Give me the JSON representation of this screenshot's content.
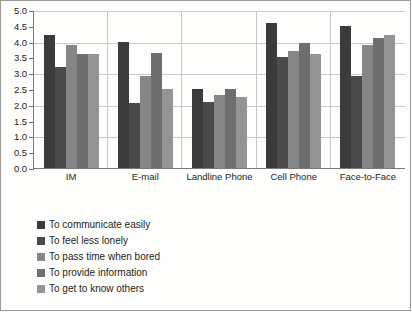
{
  "chart_data": {
    "type": "bar",
    "title": "",
    "xlabel": "",
    "ylabel": "",
    "ylim": [
      0,
      5.0
    ],
    "ytick_step": 0.5,
    "grid": true,
    "legend_position": "below",
    "categories": [
      "IM",
      "E-mail",
      "Landline Phone",
      "Cell Phone",
      "Face-to-Face"
    ],
    "ytick_labels": [
      "5.0",
      "4.5",
      "4.0",
      "3.5",
      "3.0",
      "2.5",
      "2.0",
      "1.5",
      "1.0",
      "0.5",
      "0.0"
    ],
    "ytick_values": [
      5.0,
      4.5,
      4.0,
      3.5,
      3.0,
      2.5,
      2.0,
      1.5,
      1.0,
      0.5,
      0.0
    ],
    "series": [
      {
        "name": "To communicate easily",
        "color": "#3b3b3b",
        "values": [
          4.2,
          4.0,
          2.5,
          4.6,
          4.5
        ]
      },
      {
        "name": "To feel less lonely",
        "color": "#4a4a4a",
        "values": [
          3.2,
          2.05,
          2.1,
          3.5,
          2.9
        ]
      },
      {
        "name": "To pass time when bored",
        "color": "#868686",
        "values": [
          3.9,
          2.9,
          2.3,
          3.7,
          3.9
        ]
      },
      {
        "name": "To provide information",
        "color": "#6e6e6e",
        "values": [
          3.6,
          3.65,
          2.5,
          3.95,
          4.1
        ]
      },
      {
        "name": "To get to know others",
        "color": "#949494",
        "values": [
          3.6,
          2.5,
          2.25,
          3.6,
          4.2
        ]
      }
    ]
  },
  "legend": {
    "items": [
      {
        "label": "To communicate easily"
      },
      {
        "label": "To feel less lonely"
      },
      {
        "label": "To pass time when bored"
      },
      {
        "label": "To provide information"
      },
      {
        "label": "To get to know others"
      }
    ]
  }
}
